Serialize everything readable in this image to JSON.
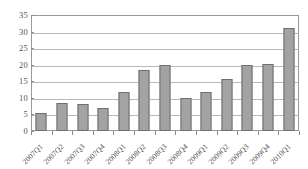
{
  "chart_data": {
    "type": "bar",
    "title": "",
    "subtitle": "",
    "xlabel": "",
    "ylabel": "",
    "categories": [
      "2007Q1",
      "2007Q2",
      "2007Q3",
      "2007Q4",
      "2008Q1",
      "2008Q2",
      "2008Q3",
      "2008Q4",
      "2009Q1",
      "2009Q2",
      "2009Q3",
      "2009Q4",
      "2010Q1"
    ],
    "values": [
      5.3,
      8.6,
      8.3,
      7.0,
      11.8,
      18.4,
      19.8,
      10.0,
      11.8,
      15.7,
      20.0,
      20.3,
      31.0
    ],
    "ylim": [
      0,
      35
    ],
    "ytick_labels": [
      "0",
      "5",
      "10",
      "15",
      "20",
      "25",
      "30",
      "35"
    ],
    "ytick_values": [
      0,
      5,
      10,
      15,
      20,
      25,
      30,
      35
    ],
    "grid": true,
    "grid_axis": "y",
    "legend": false,
    "legend_position": "none",
    "series": [
      {
        "name": "",
        "values": [
          5.3,
          8.6,
          8.3,
          7.0,
          11.8,
          18.4,
          19.8,
          10.0,
          11.8,
          15.7,
          20.0,
          20.3,
          31.0
        ]
      }
    ],
    "colors": {
      "bar_fill": "#a3a3a3",
      "bar_border": "#6f6f6f",
      "gridline": "#b9b9b9",
      "axis": "#9a9a9a",
      "text": "#4f4f4f",
      "background": "#ffffff"
    }
  }
}
